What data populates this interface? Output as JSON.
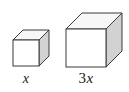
{
  "figure": {
    "background_color": "#ffffff",
    "width": 129,
    "height": 92
  },
  "style": {
    "stroke_color": "#3b3b3b",
    "front_face_color": "#ffffff",
    "top_face_color": "#f7f7f7",
    "side_face_color": "#d2d2d2",
    "stroke_width": 1,
    "text_color": "#1a1a1a"
  },
  "shapes": [
    {
      "id": "small-cube",
      "name": "small cube",
      "edge_label": "x",
      "front_face": {
        "x": 13,
        "y": 40,
        "width": 26,
        "height": 26
      },
      "depth_dx": 10,
      "depth_dy": -10
    },
    {
      "id": "large-cube",
      "name": "large cube",
      "edge_label": "3x",
      "front_face": {
        "x": 66,
        "y": 29,
        "width": 40,
        "height": 38
      },
      "depth_dx": 16,
      "depth_dy": -16
    }
  ],
  "labels": {
    "small_cube": {
      "coefficient": "",
      "variable": "x",
      "full": "x"
    },
    "large_cube": {
      "coefficient": "3",
      "variable": "x",
      "full": "3x"
    }
  }
}
